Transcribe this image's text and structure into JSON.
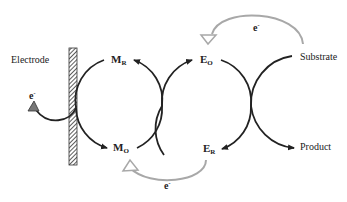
{
  "diagram": {
    "type": "mediated electron transfer cycle",
    "labels": {
      "electrode": "Electrode",
      "substrate": "Substrate",
      "product": "Product"
    },
    "species": {
      "mediator_reduced": {
        "main": "M",
        "sub": "R"
      },
      "mediator_oxidized": {
        "main": "M",
        "sub": "O"
      },
      "enzyme_oxidized": {
        "main": "E",
        "sub": "O"
      },
      "enzyme_reduced": {
        "main": "E",
        "sub": "R"
      }
    },
    "electrons": {
      "electrode": {
        "main": "e",
        "sup": "-"
      },
      "bottom": {
        "main": "e",
        "sup": "-"
      },
      "top": {
        "main": "e",
        "sup": "-"
      }
    },
    "colors": {
      "line": "#222222",
      "electron_arrow": "#a8a8a8",
      "electrode_hatch": "#333333",
      "electrode_arrowhead": "#777777"
    }
  }
}
